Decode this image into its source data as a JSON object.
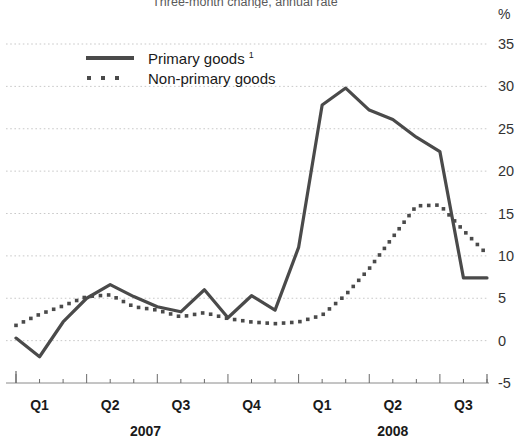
{
  "chart_data": {
    "type": "line",
    "title": "Three-month change, annual rate",
    "ylabel": "%",
    "xlabel": "",
    "ylim": [
      -5,
      35
    ],
    "yticks": [
      35,
      30,
      25,
      20,
      15,
      10,
      5,
      0,
      -5
    ],
    "grid": true,
    "legend_position": "upper-left",
    "x": [
      "2007-01",
      "2007-02",
      "2007-03",
      "2007-04",
      "2007-05",
      "2007-06",
      "2007-07",
      "2007-08",
      "2007-09",
      "2007-10",
      "2007-11",
      "2007-12",
      "2008-01",
      "2008-02",
      "2008-03",
      "2008-04",
      "2008-05",
      "2008-06",
      "2008-07",
      "2008-08",
      "2008-09"
    ],
    "xtick_labels": [
      "Q1",
      "Q2",
      "Q3",
      "Q4",
      "Q1",
      "Q2",
      "Q3"
    ],
    "xtick_groups": [
      {
        "label": "2007",
        "ticks": [
          "Q1",
          "Q2",
          "Q3",
          "Q4"
        ]
      },
      {
        "label": "2008",
        "ticks": [
          "Q1",
          "Q2",
          "Q3"
        ]
      }
    ],
    "series": [
      {
        "name": "Primary goods",
        "footnote": "1",
        "style": "solid",
        "color": "#4a4a4a",
        "values": [
          0.3,
          -1.9,
          2.2,
          5.0,
          6.6,
          5.2,
          4.0,
          3.4,
          6.0,
          2.7,
          5.3,
          3.6,
          11.0,
          27.8,
          29.8,
          27.2,
          26.1,
          24.0,
          22.3,
          7.4,
          7.4
        ]
      },
      {
        "name": "Non-primary goods",
        "footnote": "",
        "style": "dotted",
        "color": "#4a4a4a",
        "values": [
          1.8,
          3.1,
          4.1,
          5.2,
          5.4,
          4.0,
          3.6,
          2.8,
          3.3,
          2.6,
          2.2,
          2.0,
          2.2,
          3.0,
          5.4,
          8.5,
          12.2,
          15.9,
          16.0,
          13.0,
          10.2
        ]
      }
    ],
    "series_extra_tail": {
      "Non-primary goods": [
        7.2,
        5.0
      ]
    }
  },
  "legend": {
    "items": [
      {
        "label": "Primary goods",
        "footnote": "1",
        "key": "solid-line-key"
      },
      {
        "label": "Non-primary goods",
        "footnote": "",
        "key": "dotted-line-key"
      }
    ]
  },
  "axis": {
    "unit": "%",
    "y_labels": [
      "35",
      "30",
      "25",
      "20",
      "15",
      "10",
      "5",
      "0",
      "-5"
    ],
    "x_labels": [
      "Q1",
      "Q2",
      "Q3",
      "Q4",
      "Q1",
      "Q2",
      "Q3"
    ],
    "year_labels": [
      "2007",
      "2008"
    ]
  },
  "title": "Three-month change, annual rate"
}
